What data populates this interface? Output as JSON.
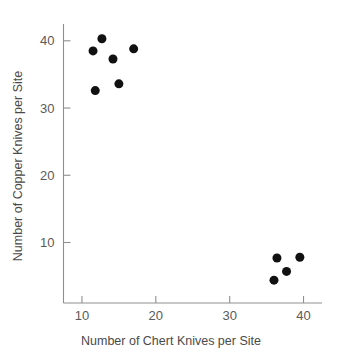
{
  "chart_data": {
    "type": "scatter",
    "title": "",
    "xlabel": "Number of Chert Knives per Site",
    "ylabel": "Number of Copper Knives per Site",
    "xlim": [
      7.5,
      42.5
    ],
    "ylim": [
      1.0,
      42.5
    ],
    "xticks": [
      10,
      20,
      30,
      40
    ],
    "yticks": [
      10,
      20,
      30,
      40
    ],
    "xtick_labels": [
      "10",
      "20",
      "30",
      "40"
    ],
    "ytick_labels": [
      "10",
      "20",
      "30",
      "40"
    ],
    "grid": false,
    "legend": null,
    "marker": "filled-circle",
    "marker_color": "#111111",
    "marker_size": 7,
    "axis_color": "#8f8f8f",
    "text_color": "#4a4a4a",
    "background": "#ffffff",
    "points": [
      {
        "x": 11.5,
        "y": 38.5
      },
      {
        "x": 12.7,
        "y": 40.3
      },
      {
        "x": 11.8,
        "y": 32.6
      },
      {
        "x": 14.2,
        "y": 37.3
      },
      {
        "x": 15.0,
        "y": 33.6
      },
      {
        "x": 17.0,
        "y": 38.8
      },
      {
        "x": 36.0,
        "y": 4.4
      },
      {
        "x": 36.4,
        "y": 7.7
      },
      {
        "x": 37.7,
        "y": 5.7
      },
      {
        "x": 39.5,
        "y": 7.8
      }
    ]
  }
}
